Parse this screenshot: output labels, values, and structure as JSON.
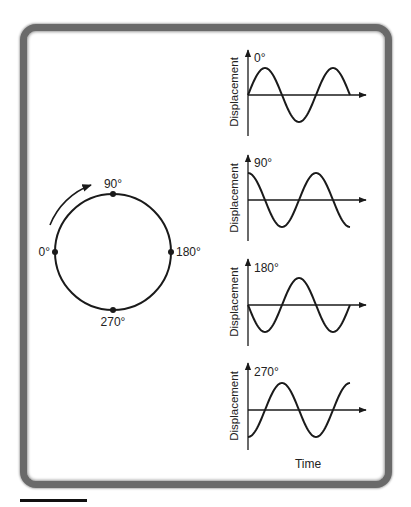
{
  "circle": {
    "labels": {
      "top": "90°",
      "right": "180°",
      "bottom": "270°",
      "left": "0°"
    },
    "rotation_arrow": "clockwise-arrow"
  },
  "graphs": [
    {
      "phase_label": "0°",
      "y_label": "Displacement"
    },
    {
      "phase_label": "90°",
      "y_label": "Displacement"
    },
    {
      "phase_label": "180°",
      "y_label": "Displacement"
    },
    {
      "phase_label": "270°",
      "y_label": "Displacement"
    }
  ],
  "x_label": "Time",
  "colors": {
    "line": "#1a1a1a",
    "frame": "#6a6a6a",
    "background": "#ffffff"
  }
}
